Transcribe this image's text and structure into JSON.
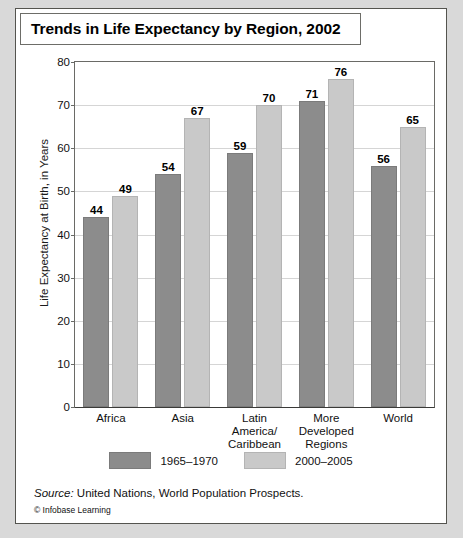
{
  "card": {
    "title": "Trends in Life Expectancy by Region, 2002",
    "source_word": "Source:",
    "source_text": " United Nations, World Population Prospects.",
    "credit": "© Infobase Learning"
  },
  "chart_data": {
    "type": "bar",
    "title": "Trends in Life Expectancy by Region, 2002",
    "xlabel": "",
    "ylabel": "Life Expectancy at Birth, in Years",
    "ylim": [
      0,
      80
    ],
    "ytick_step": 10,
    "yticks": [
      0,
      10,
      20,
      30,
      40,
      50,
      60,
      70,
      80
    ],
    "grid": true,
    "legend_position": "bottom",
    "categories": [
      "Africa",
      "Latin America/\nCaribbean",
      "Asia",
      "More\nDeveloped\nRegions",
      "World"
    ],
    "category_list": [
      {
        "lines": [
          "Africa"
        ]
      },
      {
        "lines": [
          "Asia"
        ]
      },
      {
        "lines": [
          "Latin America/",
          "Caribbean"
        ]
      },
      {
        "lines": [
          "More",
          "Developed",
          "Regions"
        ]
      },
      {
        "lines": [
          "World"
        ]
      }
    ],
    "series": [
      {
        "name": "1965–1970",
        "color": "#8c8c8c",
        "values": [
          44,
          54,
          59,
          71,
          56
        ]
      },
      {
        "name": "2000–2005",
        "color": "#c9c9c9",
        "values": [
          49,
          67,
          70,
          76,
          65
        ]
      }
    ],
    "colors": {
      "series_1965_1970": "#8c8c8c",
      "series_2000_2005": "#c9c9c9",
      "gridline": "#d5d5d5",
      "axis": "#6a6a66",
      "page_background": "#d9d9d9",
      "card_background": "#ffffff"
    }
  }
}
